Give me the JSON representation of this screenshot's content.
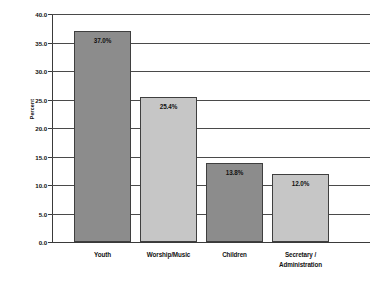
{
  "chart_data": {
    "type": "bar",
    "title": "",
    "subtitle": "",
    "xlabel": "",
    "ylabel": "Percent",
    "ylim": [
      0.0,
      40.0
    ],
    "ytick_step": 5.0,
    "ytick_labels": [
      "40.0",
      "35.0",
      "30.0",
      "25.0",
      "20.0",
      "15.0",
      "10.0",
      "5.0",
      "0.0"
    ],
    "ytick_values": [
      40.0,
      35.0,
      30.0,
      25.0,
      20.0,
      15.0,
      10.0,
      5.0,
      0.0
    ],
    "grid": true,
    "grid_axis": "y",
    "legend": false,
    "legend_position": "none",
    "categories": [
      "Youth",
      "Worship/Music",
      "Children",
      "Secretary / Administration"
    ],
    "category_lines": [
      [
        "Youth"
      ],
      [
        "Worship/Music"
      ],
      [
        "Children"
      ],
      [
        "Secretary /",
        "Administration"
      ]
    ],
    "values": [
      37.0,
      25.4,
      13.8,
      12.0
    ],
    "data_labels": [
      "37.0%",
      "25.4%",
      "13.8%",
      "12.0%"
    ],
    "bar_colors": [
      "#8c8c8c",
      "#c6c6c6",
      "#8c8c8c",
      "#c6c6c6"
    ],
    "bar_edge_color": "#3f3f3f"
  },
  "colors": {
    "background": "#ffffff",
    "axis": "#3a3a3a",
    "grid": "#4a4a4a",
    "text": "#111111",
    "bar_dark": "#8c8c8c",
    "bar_light": "#c6c6c6"
  }
}
